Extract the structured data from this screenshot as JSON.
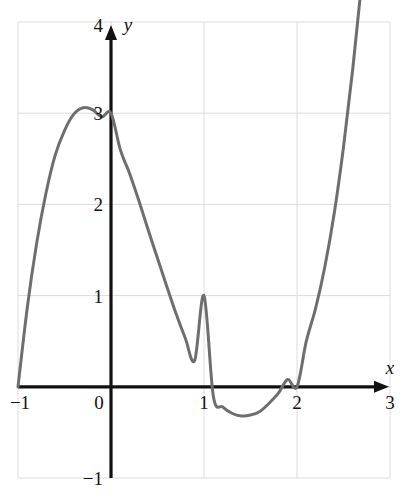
{
  "chart_data": {
    "type": "line",
    "title": "",
    "subtitle": "",
    "xlabel": "x",
    "ylabel": "y",
    "xlim": [
      -1,
      3
    ],
    "ylim": [
      -1,
      4
    ],
    "grid": true,
    "legend": null,
    "xticks": [
      -1,
      0,
      1,
      2,
      3
    ],
    "xtick_labels": [
      "−1",
      "0",
      "1",
      "2",
      "3"
    ],
    "yticks": [
      -1,
      1,
      2,
      3,
      4
    ],
    "ytick_labels": [
      "−1",
      "1",
      "2",
      "3",
      "4"
    ],
    "line_color": "#6e6e6e",
    "axis_color": "#111111",
    "grid_color": "#dcdcdc",
    "series": [
      {
        "name": "cubic",
        "equation": "y = (x+1)(x-1.5)(x-2)",
        "roots": [
          -1,
          1.5,
          2
        ],
        "y_intercept": 3,
        "local_max": {
          "x": -0.06,
          "y": 3.02
        },
        "local_min": {
          "x": 1.79,
          "y": -0.13
        },
        "x": [
          -1.0,
          -0.9,
          -0.8,
          -0.7,
          -0.6,
          -0.5,
          -0.4,
          -0.3,
          -0.2,
          -0.1,
          0.0,
          0.1,
          0.2,
          0.3,
          0.4,
          0.5,
          0.6,
          0.7,
          0.8,
          0.9,
          1.0,
          1.1,
          1.2,
          1.3,
          1.4,
          1.5,
          1.6,
          1.7,
          1.8,
          1.9,
          2.0,
          2.1,
          2.2,
          2.3,
          2.4,
          2.5,
          2.6,
          2.7,
          2.8
        ],
        "y": [
          0.0,
          0.87,
          1.57,
          2.12,
          2.54,
          2.81,
          2.99,
          3.06,
          3.04,
          2.96,
          3.0,
          2.6,
          2.34,
          2.04,
          1.72,
          1.41,
          1.1,
          0.8,
          0.53,
          0.29,
          1.0,
          -0.1,
          -0.22,
          -0.29,
          -0.32,
          -0.31,
          -0.27,
          -0.18,
          -0.07,
          0.08,
          0.0,
          0.5,
          0.86,
          1.32,
          1.9,
          2.63,
          3.49,
          4.48,
          5.62
        ]
      }
    ]
  },
  "axis_arrows": {
    "x_arrow": true,
    "y_arrow": true
  },
  "icons": {
    "x_axis_arrow": "arrow-right-icon",
    "y_axis_arrow": "arrow-up-icon"
  }
}
